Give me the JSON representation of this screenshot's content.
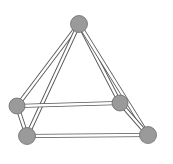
{
  "diagram": {
    "title": "",
    "type": "square-pyramid-ball-and-stick",
    "colors": {
      "background": "#ffffff",
      "edge_outline": "#555555",
      "edge_fill": "#ffffff",
      "node_fill": "#9a9a9a",
      "node_stroke": "#6e6e6e"
    },
    "nodes": [
      {
        "id": "apex",
        "x": 79,
        "y": 24,
        "r": 8.5
      },
      {
        "id": "back-left",
        "x": 17,
        "y": 106,
        "r": 8
      },
      {
        "id": "back-right",
        "x": 120,
        "y": 103,
        "r": 8
      },
      {
        "id": "front-left",
        "x": 27,
        "y": 136,
        "r": 8.5
      },
      {
        "id": "front-right",
        "x": 148,
        "y": 135,
        "r": 8.5
      }
    ],
    "edges": [
      {
        "from": "apex",
        "to": "back-left"
      },
      {
        "from": "apex",
        "to": "back-right"
      },
      {
        "from": "apex",
        "to": "front-left"
      },
      {
        "from": "apex",
        "to": "front-right"
      },
      {
        "from": "back-left",
        "to": "back-right"
      },
      {
        "from": "front-left",
        "to": "front-right"
      },
      {
        "from": "back-left",
        "to": "front-left"
      },
      {
        "from": "back-right",
        "to": "front-right"
      }
    ]
  }
}
